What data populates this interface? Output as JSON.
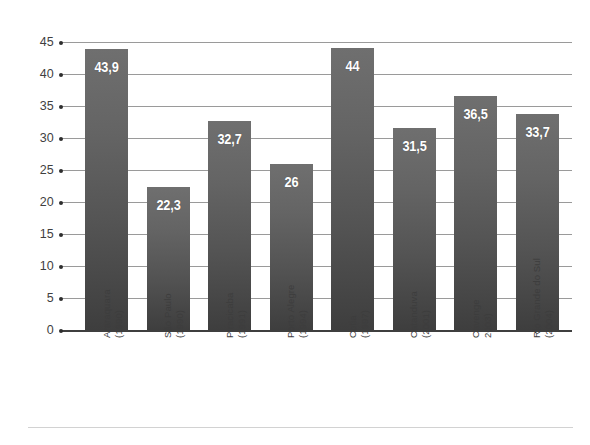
{
  "chart_data": {
    "type": "bar",
    "title": "",
    "subtitle": "",
    "xlabel": "",
    "ylabel": "",
    "ylim": [
      0,
      45
    ],
    "grid": true,
    "legend": false,
    "decimal_separator": ",",
    "categories": [
      "Araraquara (1990)",
      "São Paulo (1990)",
      "Piracicaba (1991)",
      "Porto Alegre (1994)",
      "Cotia (1997)",
      "Catanduva (2001)",
      "Cavenge 2003)",
      "Rio Grande do Sul (2004)"
    ],
    "category_lines": [
      {
        "line1": "Araraquara",
        "line2": "(1990)"
      },
      {
        "line1": "São Paulo",
        "line2": "(1990)"
      },
      {
        "line1": "Piracicaba",
        "line2": "(1991)"
      },
      {
        "line1": "Porto Alegre",
        "line2": "(1994)"
      },
      {
        "line1": "Cotia",
        "line2": "(1997)"
      },
      {
        "line1": "Catanduva",
        "line2": "(2001)"
      },
      {
        "line1": "Cavenge",
        "line2": "2003)"
      },
      {
        "line1": "Rio Grande do Sul",
        "line2": "(2004)"
      }
    ],
    "values": [
      43.9,
      22.3,
      32.7,
      26,
      44,
      31.5,
      36.5,
      33.7
    ],
    "value_labels": [
      "43,9",
      "22,3",
      "32,7",
      "26",
      "44",
      "31,5",
      "36,5",
      "33,7"
    ],
    "y_ticks": [
      0,
      5,
      10,
      15,
      20,
      25,
      30,
      35,
      40,
      45
    ],
    "y_tick_labels": [
      "0",
      "5",
      "10",
      "15",
      "20",
      "25",
      "30",
      "35",
      "40",
      "45"
    ],
    "colors": {
      "bar_top": "#6f6f6f",
      "bar_bottom": "#3e3e3e",
      "gridline": "#9a9a9a",
      "axis": "#3f3f3f",
      "value_label": "#ffffff",
      "tick_label": "#3f3f3f",
      "background": "#ffffff"
    }
  }
}
